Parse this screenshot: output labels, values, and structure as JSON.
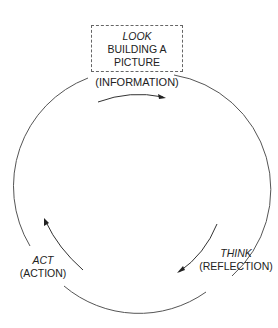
{
  "diagram": {
    "type": "cycle",
    "stages": [
      {
        "id": "look",
        "title": "LOOK",
        "subtitle": "BUILDING A PICTURE",
        "subtitle_lines": [
          "BUILDING A",
          "PICTURE"
        ],
        "detail": "(INFORMATION)",
        "boxed": true
      },
      {
        "id": "think",
        "title": "THINK",
        "detail": "(REFLECTION)"
      },
      {
        "id": "act",
        "title": "ACT",
        "detail": "(ACTION)"
      }
    ],
    "flow_direction": "clockwise",
    "colors": {
      "line": "#555555",
      "text": "#222222",
      "box_border": "#666666"
    }
  }
}
